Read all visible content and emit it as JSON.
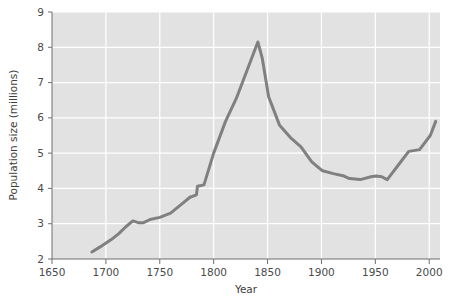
{
  "chart_data": {
    "type": "line",
    "title": "",
    "xlabel": "Year",
    "ylabel": "Population size (millions)",
    "xlim": [
      1650,
      2010
    ],
    "ylim": [
      2,
      9
    ],
    "xticks": [
      1650,
      1700,
      1750,
      1800,
      1850,
      1900,
      1950,
      2000
    ],
    "xtick_labels": [
      "1650",
      "1700",
      "1750",
      "1800",
      "1850",
      "1900",
      "1950",
      "2000"
    ],
    "yticks": [
      2,
      3,
      4,
      5,
      6,
      7,
      8,
      9
    ],
    "ytick_labels": [
      "2",
      "3",
      "4",
      "5",
      "6",
      "7",
      "8",
      "9"
    ],
    "grid": true,
    "grid_color": "#ffffff",
    "plot_background": "#e2e2e2",
    "line_color": "#808080",
    "line_width": 3,
    "legend": null,
    "series": [
      {
        "name": "Population size",
        "x": [
          1687,
          1695,
          1705,
          1712,
          1718,
          1725,
          1730,
          1735,
          1741,
          1750,
          1760,
          1770,
          1778,
          1784,
          1785,
          1791,
          1800,
          1811,
          1821,
          1831,
          1841,
          1845,
          1851,
          1861,
          1871,
          1881,
          1891,
          1901,
          1911,
          1921,
          1926,
          1936,
          1946,
          1951,
          1956,
          1961,
          1966,
          1971,
          1981,
          1991,
          2001,
          2006
        ],
        "y": [
          2.2,
          2.35,
          2.55,
          2.72,
          2.9,
          3.08,
          3.03,
          3.03,
          3.12,
          3.18,
          3.3,
          3.55,
          3.75,
          3.82,
          4.06,
          4.1,
          5.0,
          5.9,
          6.55,
          7.35,
          8.15,
          7.7,
          6.6,
          5.8,
          5.45,
          5.18,
          4.75,
          4.5,
          4.42,
          4.35,
          4.28,
          4.25,
          4.33,
          4.35,
          4.33,
          4.25,
          4.45,
          4.65,
          5.05,
          5.1,
          5.5,
          5.9
        ],
        "color": "#808080"
      }
    ]
  },
  "axis": {
    "y_title": "Population size (millions)",
    "x_title": "Year"
  }
}
